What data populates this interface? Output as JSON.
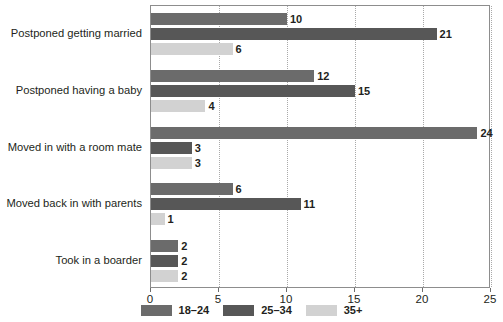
{
  "chart_data": {
    "type": "bar",
    "orientation": "horizontal",
    "title": "",
    "xlabel": "",
    "ylabel": "",
    "xlim": [
      0,
      25
    ],
    "xticks": [
      0,
      5,
      10,
      15,
      20,
      25
    ],
    "grid": true,
    "legend_position": "bottom-center",
    "categories": [
      "Postponed getting married",
      "Postponed having a baby",
      "Moved in with a room mate",
      "Moved back in with parents",
      "Took in a boarder"
    ],
    "series": [
      {
        "name": "18–24",
        "color": "#6b6b6b",
        "values": [
          10,
          12,
          24,
          6,
          2
        ]
      },
      {
        "name": "25–34",
        "color": "#575757",
        "values": [
          21,
          15,
          3,
          11,
          2
        ]
      },
      {
        "name": "35+",
        "color": "#d2d2d2",
        "values": [
          6,
          4,
          3,
          1,
          2
        ]
      }
    ]
  },
  "axis": {
    "tick_labels": [
      "0",
      "5",
      "10",
      "15",
      "20",
      "25"
    ]
  },
  "legend": {
    "items": [
      {
        "label": "18–24",
        "color": "#6b6b6b"
      },
      {
        "label": "25–34",
        "color": "#575757"
      },
      {
        "label": "35+",
        "color": "#d2d2d2"
      }
    ]
  },
  "style": {
    "plot_border_color": "#8d8d8d",
    "gridline_color": "#a9a9a9",
    "text_color": "#231f20",
    "background": "#ffffff"
  }
}
